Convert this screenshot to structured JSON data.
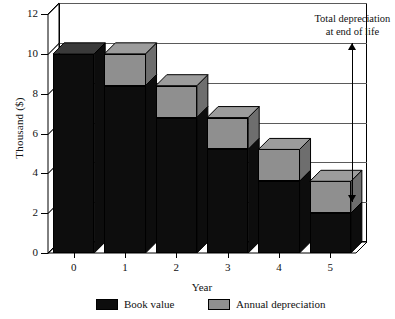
{
  "chart_data": {
    "type": "bar",
    "title": "",
    "subtitle": "",
    "stacked": true,
    "three_d": true,
    "xlabel": "Year",
    "ylabel": "Thousand ($)",
    "categories": [
      "0",
      "1",
      "2",
      "3",
      "4",
      "5"
    ],
    "x": [
      0,
      1,
      2,
      3,
      4,
      5
    ],
    "ylim": [
      0,
      12
    ],
    "yticks": [
      0,
      2,
      4,
      6,
      8,
      10,
      12
    ],
    "ytick_labels": [
      "0",
      "2",
      "4",
      "6",
      "8",
      "10",
      "12"
    ],
    "grid": true,
    "grid_axis": "y",
    "legend_position": "bottom",
    "series": [
      {
        "name": "Book value",
        "color": "#0d0d0d",
        "values": [
          10.0,
          8.4,
          6.8,
          5.2,
          3.6,
          2.0
        ]
      },
      {
        "name": "Annual depreciation",
        "color": "#8f8f8f",
        "values": [
          0.0,
          1.6,
          1.6,
          1.6,
          1.6,
          1.6
        ]
      }
    ],
    "totals": [
      10.0,
      10.0,
      8.4,
      6.8,
      5.2,
      3.6
    ],
    "annotations": [
      {
        "text_line1": "Total depreciation",
        "text_line2": "at end of life",
        "arrow": "double",
        "arrow_from_value": 10.0,
        "arrow_to_value": 2.0,
        "at_category": "5"
      }
    ]
  },
  "axes": {
    "y_title": "Thousand ($)",
    "x_title": "Year",
    "y_tick_labels": [
      "12",
      "10",
      "8",
      "6",
      "4",
      "2",
      "0"
    ],
    "x_tick_labels": [
      "0",
      "1",
      "2",
      "3",
      "4",
      "5"
    ]
  },
  "legend": {
    "items": [
      {
        "label": "Book value",
        "color": "#0d0d0d"
      },
      {
        "label": "Annual depreciation",
        "color": "#8f8f8f"
      }
    ]
  },
  "annotation": {
    "line1": "Total depreciation",
    "line2": "at end of life"
  },
  "colors": {
    "book_value": "#0d0d0d",
    "annual_depreciation": "#8f8f8f",
    "annual_depreciation_side": "#6e6e6e",
    "annual_depreciation_top": "#9c9c9c",
    "axis": "#000000",
    "grid": "#5a5a5a",
    "background": "#ffffff"
  }
}
